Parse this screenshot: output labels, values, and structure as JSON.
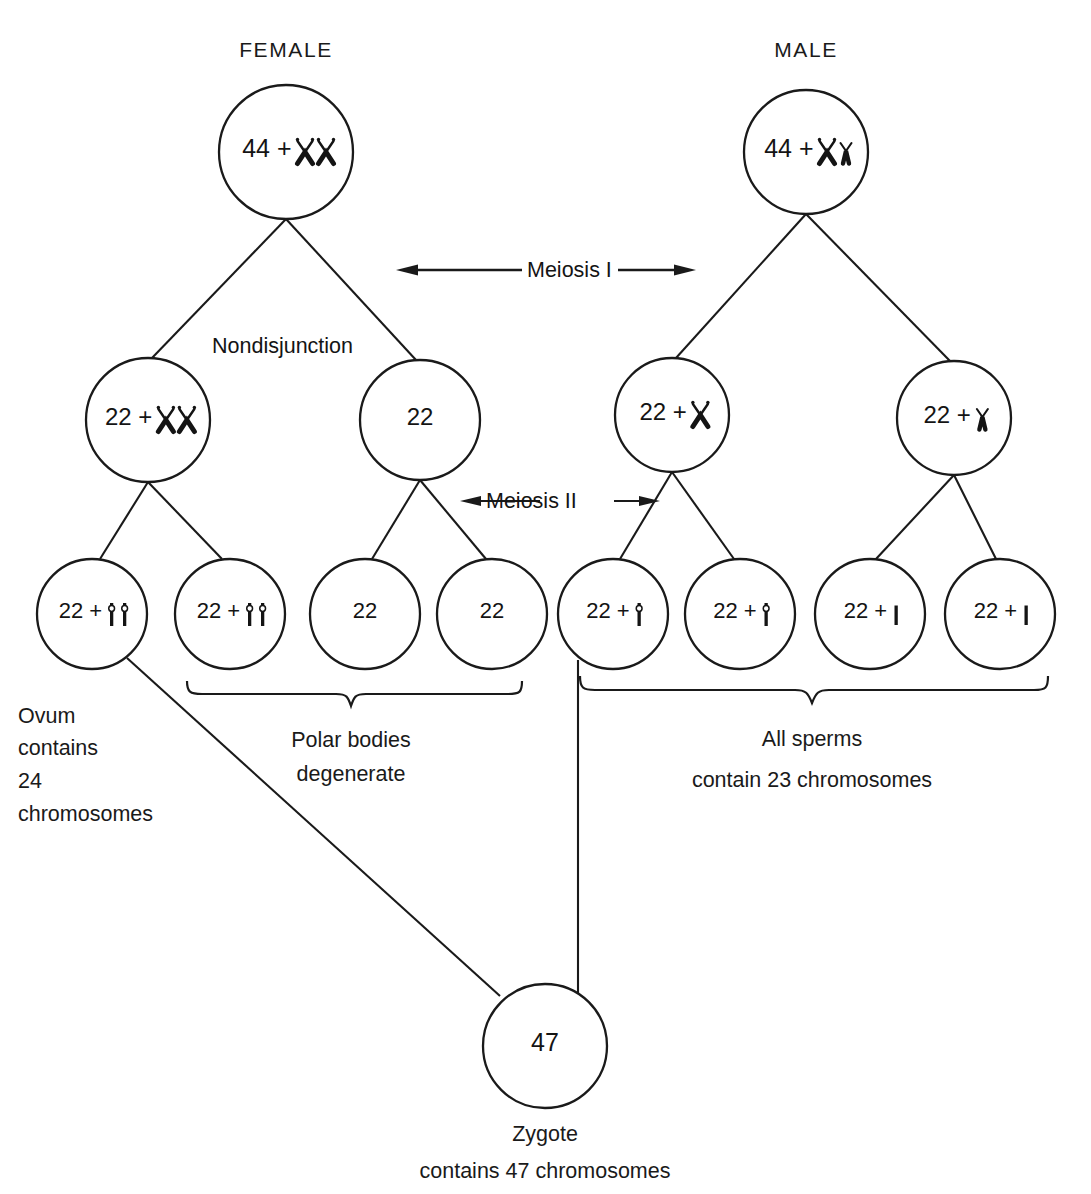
{
  "diagram": {
    "stroke_color": "#1a1a1a",
    "background_color": "#ffffff",
    "headers": {
      "female": "FEMALE",
      "male": "MALE"
    },
    "stage_labels": {
      "meiosis_1": "Meiosis I",
      "meiosis_2": "Meiosis II",
      "nondisjunction": "Nondisjunction"
    },
    "rows": {
      "parent": [
        {
          "id": "female-parent",
          "number": "44",
          "plus": "+",
          "chromosomes": "XX",
          "glyphs": [
            "X-chromosome",
            "X-chromosome"
          ],
          "cx": 286,
          "cy": 152,
          "r": 67
        },
        {
          "id": "male-parent",
          "number": "44",
          "plus": "+",
          "chromosomes": "XY",
          "glyphs": [
            "X-chromosome",
            "Y-chromosome"
          ],
          "cx": 806,
          "cy": 152,
          "r": 62
        }
      ],
      "secondary": [
        {
          "id": "oocyte-xx",
          "number": "22",
          "plus": "+",
          "chromosomes": "XX",
          "glyphs": [
            "X-chromosome",
            "X-chromosome"
          ],
          "cx": 148,
          "cy": 420,
          "r": 62
        },
        {
          "id": "oocyte-none",
          "number": "22",
          "plus": "",
          "chromosomes": "",
          "glyphs": [],
          "cx": 420,
          "cy": 420,
          "r": 60
        },
        {
          "id": "spermatocyte-x",
          "number": "22",
          "plus": "+",
          "chromosomes": "X",
          "glyphs": [
            "X-chromosome"
          ],
          "cx": 672,
          "cy": 415,
          "r": 57
        },
        {
          "id": "spermatocyte-y",
          "number": "22",
          "plus": "+",
          "chromosomes": "Y",
          "glyphs": [
            "Y-chromosome"
          ],
          "cx": 954,
          "cy": 418,
          "r": 57
        }
      ],
      "gametes": [
        {
          "id": "ovum-xx",
          "number": "22",
          "plus": "+",
          "chromosomes": "XX",
          "glyphs": [
            "X-chromatid",
            "X-chromatid"
          ],
          "cx": 92,
          "cy": 614,
          "r": 55
        },
        {
          "id": "polar-body-xx",
          "number": "22",
          "plus": "+",
          "chromosomes": "XX",
          "glyphs": [
            "X-chromatid",
            "X-chromatid"
          ],
          "cx": 230,
          "cy": 614,
          "r": 55
        },
        {
          "id": "polar-body-1",
          "number": "22",
          "plus": "",
          "chromosomes": "",
          "glyphs": [],
          "cx": 365,
          "cy": 614,
          "r": 55
        },
        {
          "id": "polar-body-2",
          "number": "22",
          "plus": "",
          "chromosomes": "",
          "glyphs": [],
          "cx": 492,
          "cy": 614,
          "r": 55
        },
        {
          "id": "sperm-x-1",
          "number": "22",
          "plus": "+",
          "chromosomes": "X",
          "glyphs": [
            "X-chromatid"
          ],
          "cx": 613,
          "cy": 614,
          "r": 55
        },
        {
          "id": "sperm-x-2",
          "number": "22",
          "plus": "+",
          "chromosomes": "X",
          "glyphs": [
            "X-chromatid"
          ],
          "cx": 740,
          "cy": 614,
          "r": 55
        },
        {
          "id": "sperm-y-1",
          "number": "22",
          "plus": "+",
          "chromosomes": "Y",
          "glyphs": [
            "Y-chromatid"
          ],
          "cx": 870,
          "cy": 614,
          "r": 55
        },
        {
          "id": "sperm-y-2",
          "number": "22",
          "plus": "+",
          "chromosomes": "Y",
          "glyphs": [
            "Y-chromatid"
          ],
          "cx": 1000,
          "cy": 614,
          "r": 55
        }
      ],
      "zygote": {
        "id": "zygote",
        "number": "47",
        "cx": 545,
        "cy": 1046,
        "r": 62
      }
    },
    "captions": {
      "ovum": [
        "Ovum",
        "contains",
        "24",
        "chromosomes"
      ],
      "polar_bodies": [
        "Polar  bodies",
        "degenerate"
      ],
      "sperms": [
        "All sperms",
        "contain 23 chromosomes"
      ],
      "zygote": [
        "Zygote",
        "contains 47 chromosomes"
      ]
    }
  }
}
